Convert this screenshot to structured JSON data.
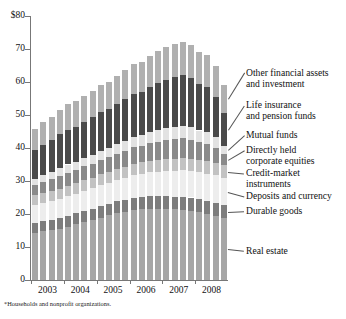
{
  "footnote": "*Households and nonprofit organizations.",
  "axis": {
    "y_top_label": "$80",
    "y_labels": [
      "$80",
      "70",
      "60",
      "50",
      "40",
      "30",
      "20",
      "10",
      "0"
    ],
    "y_values": [
      80,
      70,
      60,
      50,
      40,
      30,
      20,
      10,
      0
    ],
    "x_labels": [
      "2003",
      "2004",
      "2005",
      "2006",
      "2007",
      "2008"
    ]
  },
  "legend": [
    {
      "label_line1": "Other financial assets",
      "label_line2": "and investment",
      "color": "#b0b0b0"
    },
    {
      "label_line1": "Life insurance",
      "label_line2": "and pension funds",
      "color": "#4a4a4a"
    },
    {
      "label_line1": "Mutual funds",
      "label_line2": "",
      "color": "#e2e2e2"
    },
    {
      "label_line1": "Directly held",
      "label_line2": "corporate equities",
      "color": "#8a8a8a"
    },
    {
      "label_line1": "Credit-market",
      "label_line2": "instruments",
      "color": "#c2c2c2"
    },
    {
      "label_line1": "Deposits and currency",
      "label_line2": "",
      "color": "#ededed"
    },
    {
      "label_line1": "Durable goods",
      "label_line2": "",
      "color": "#7d7d7d"
    },
    {
      "label_line1": "Real estate",
      "label_line2": "",
      "color": "#a6a6a6"
    }
  ],
  "chart_data": {
    "type": "bar",
    "title": "",
    "subtitle": "",
    "xlabel": "",
    "ylabel": "",
    "ylim": [
      0,
      80
    ],
    "grid": false,
    "stacked": true,
    "legend_position": "right",
    "categories": [
      "2003:Q1",
      "2003:Q2",
      "2003:Q3",
      "2003:Q4",
      "2004:Q1",
      "2004:Q2",
      "2004:Q3",
      "2004:Q4",
      "2005:Q1",
      "2005:Q2",
      "2005:Q3",
      "2005:Q4",
      "2006:Q1",
      "2006:Q2",
      "2006:Q3",
      "2006:Q4",
      "2007:Q1",
      "2007:Q2",
      "2007:Q3",
      "2007:Q4",
      "2008:Q1",
      "2008:Q2",
      "2008:Q3",
      "2008:Q4"
    ],
    "series": [
      {
        "name": "Real estate",
        "color": "#a6a6a6",
        "values": [
          14.2,
          14.7,
          15.1,
          15.6,
          16.2,
          16.9,
          17.6,
          18.2,
          18.9,
          19.6,
          20.2,
          20.7,
          21.2,
          21.5,
          21.6,
          21.6,
          21.5,
          21.4,
          21.3,
          21.0,
          20.5,
          20.0,
          19.4,
          18.7
        ]
      },
      {
        "name": "Durable goods",
        "color": "#7d7d7d",
        "values": [
          3.1,
          3.1,
          3.2,
          3.2,
          3.3,
          3.3,
          3.4,
          3.4,
          3.5,
          3.5,
          3.6,
          3.6,
          3.7,
          3.7,
          3.8,
          3.8,
          3.9,
          3.9,
          4.0,
          4.0,
          4.0,
          4.0,
          4.0,
          3.9
        ]
      },
      {
        "name": "Deposits and currency",
        "color": "#ededed",
        "values": [
          5.5,
          5.6,
          5.7,
          5.8,
          5.9,
          6.0,
          6.1,
          6.2,
          6.3,
          6.4,
          6.5,
          6.6,
          6.8,
          7.0,
          7.2,
          7.4,
          7.6,
          7.8,
          7.9,
          8.0,
          8.1,
          8.2,
          8.3,
          8.4
        ]
      },
      {
        "name": "Credit-market instruments",
        "color": "#c2c2c2",
        "values": [
          2.9,
          2.9,
          3.0,
          3.0,
          3.1,
          3.1,
          3.2,
          3.2,
          3.3,
          3.3,
          3.4,
          3.4,
          3.5,
          3.5,
          3.6,
          3.6,
          3.7,
          3.7,
          3.8,
          3.8,
          3.8,
          3.8,
          3.8,
          3.7
        ]
      },
      {
        "name": "Directly held corporate equities",
        "color": "#8a8a8a",
        "values": [
          3.1,
          3.4,
          3.6,
          3.9,
          4.0,
          4.0,
          4.1,
          4.3,
          4.4,
          4.4,
          4.6,
          4.8,
          5.0,
          5.0,
          5.2,
          5.5,
          5.6,
          5.8,
          5.9,
          5.7,
          5.3,
          5.2,
          4.6,
          3.6
        ]
      },
      {
        "name": "Mutual funds",
        "color": "#e2e2e2",
        "values": [
          1.9,
          2.1,
          2.2,
          2.4,
          2.5,
          2.5,
          2.6,
          2.7,
          2.8,
          2.8,
          2.9,
          3.1,
          3.2,
          3.2,
          3.4,
          3.6,
          3.7,
          3.8,
          3.9,
          3.8,
          3.6,
          3.5,
          3.1,
          2.4
        ]
      },
      {
        "name": "Life insurance and pension funds",
        "color": "#4a4a4a",
        "values": [
          8.6,
          9.2,
          9.6,
          10.3,
          10.6,
          10.7,
          11.0,
          11.4,
          11.7,
          11.8,
          12.2,
          12.6,
          13.1,
          13.2,
          13.7,
          14.3,
          14.7,
          15.1,
          15.3,
          14.9,
          14.1,
          13.8,
          12.3,
          9.8
        ]
      },
      {
        "name": "Other financial assets and investment",
        "color": "#b0b0b0",
        "values": [
          6.5,
          6.8,
          7.0,
          7.4,
          7.6,
          7.7,
          7.8,
          8.0,
          8.2,
          8.3,
          8.5,
          8.7,
          9.0,
          9.1,
          9.3,
          9.6,
          9.8,
          10.0,
          10.1,
          10.0,
          9.7,
          9.6,
          9.2,
          8.6
        ]
      }
    ],
    "totals": [
      45.8,
      47.8,
      49.4,
      51.6,
      53.2,
      54.2,
      55.8,
      57.4,
      59.1,
      60.1,
      61.9,
      63.5,
      65.5,
      66.2,
      67.8,
      69.4,
      70.5,
      71.5,
      72.2,
      71.2,
      69.1,
      68.1,
      64.7,
      59.1
    ],
    "units": "trillions of dollars"
  }
}
